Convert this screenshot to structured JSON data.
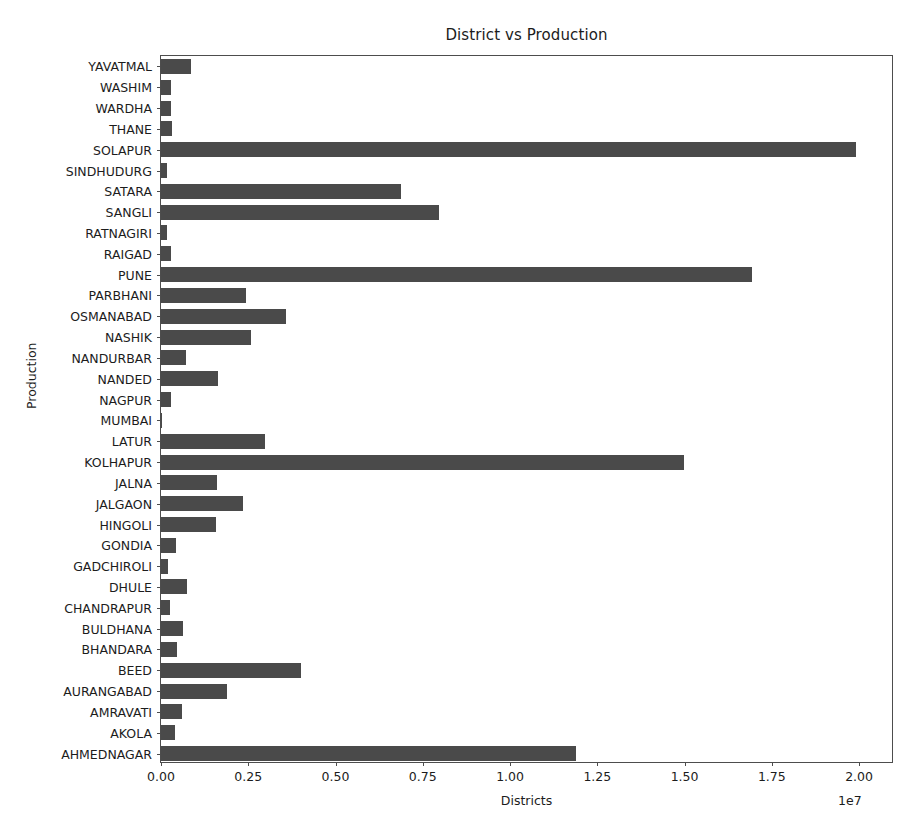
{
  "chart_data": {
    "type": "bar",
    "orientation": "horizontal",
    "title": "District vs Production",
    "xlabel": "Districts",
    "ylabel": "Production",
    "x_offset_text": "1e7",
    "xlim": [
      0,
      21000000
    ],
    "xticks": [
      0,
      2500000,
      5000000,
      7500000,
      10000000,
      12500000,
      15000000,
      17500000,
      20000000
    ],
    "xtick_labels": [
      "0.00",
      "0.25",
      "0.50",
      "0.75",
      "1.00",
      "1.25",
      "1.50",
      "1.75",
      "2.00"
    ],
    "grid": false,
    "legend": null,
    "bar_color": "#4a4a4a",
    "categories": [
      "YAVATMAL",
      "WASHIM",
      "WARDHA",
      "THANE",
      "SOLAPUR",
      "SINDHUDURG",
      "SATARA",
      "SANGLI",
      "RATNAGIRI",
      "RAIGAD",
      "PUNE",
      "PARBHANI",
      "OSMANABAD",
      "NASHIK",
      "NANDURBAR",
      "NANDED",
      "NAGPUR",
      "MUMBAI",
      "LATUR",
      "KOLHAPUR",
      "JALNA",
      "JALGAON",
      "HINGOLI",
      "GONDIA",
      "GADCHIROLI",
      "DHULE",
      "CHANDRAPUR",
      "BULDHANA",
      "BHANDARA",
      "BEED",
      "AURANGABAD",
      "AMRAVATI",
      "AKOLA",
      "AHMEDNAGAR"
    ],
    "values": [
      860000,
      300000,
      290000,
      310000,
      19900000,
      180000,
      6880000,
      7970000,
      170000,
      300000,
      16930000,
      2430000,
      3580000,
      2580000,
      720000,
      1630000,
      290000,
      20000,
      2980000,
      14980000,
      1600000,
      2350000,
      1580000,
      420000,
      200000,
      740000,
      250000,
      630000,
      450000,
      4010000,
      1890000,
      600000,
      390000,
      11900000
    ]
  }
}
